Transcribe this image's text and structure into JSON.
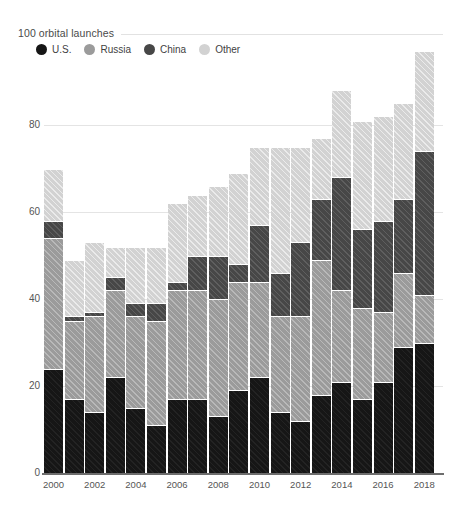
{
  "chart_data": {
    "type": "bar",
    "stacked": true,
    "title": "100 orbital launches",
    "xlabel": "",
    "ylabel": "",
    "ylim": [
      0,
      100
    ],
    "yticks": [
      0,
      20,
      40,
      60,
      80
    ],
    "ytick_labels": [
      "0",
      "20",
      "40",
      "60",
      "80"
    ],
    "grid": "horizontal",
    "legend_position": "top-left",
    "legend": [
      "U.S.",
      "Russia",
      "China",
      "Other"
    ],
    "colors": {
      "U.S.": "#161616",
      "Russia": "#9b9b9b",
      "China": "#474747",
      "Other": "#d2d2d2"
    },
    "categories": [
      "2000",
      "2001",
      "2002",
      "2003",
      "2004",
      "2005",
      "2006",
      "2007",
      "2008",
      "2009",
      "2010",
      "2011",
      "2012",
      "2013",
      "2014",
      "2015",
      "2016",
      "2017",
      "2018"
    ],
    "xtick_labels": [
      "2000",
      "2002",
      "2004",
      "2006",
      "2008",
      "2010",
      "2012",
      "2014",
      "2016",
      "2018"
    ],
    "series": [
      {
        "name": "U.S.",
        "values": [
          24,
          17,
          14,
          22,
          15,
          11,
          17,
          17,
          13,
          19,
          22,
          14,
          12,
          18,
          21,
          17,
          21,
          29,
          30
        ]
      },
      {
        "name": "Russia",
        "values": [
          30,
          18,
          22,
          20,
          21,
          24,
          25,
          25,
          27,
          25,
          22,
          22,
          24,
          31,
          21,
          21,
          16,
          17,
          11
        ]
      },
      {
        "name": "China",
        "values": [
          4,
          1,
          1,
          3,
          3,
          4,
          2,
          8,
          10,
          4,
          13,
          10,
          17,
          14,
          26,
          18,
          21,
          17,
          33
        ]
      },
      {
        "name": "Other",
        "values": [
          12,
          13,
          16,
          7,
          13,
          13,
          18,
          14,
          16,
          21,
          18,
          29,
          22,
          14,
          20,
          25,
          24,
          22,
          23
        ]
      }
    ],
    "totals": [
      70,
      49,
      53,
      52,
      52,
      52,
      62,
      64,
      66,
      69,
      75,
      75,
      75,
      77,
      88,
      81,
      82,
      85,
      97
    ]
  }
}
